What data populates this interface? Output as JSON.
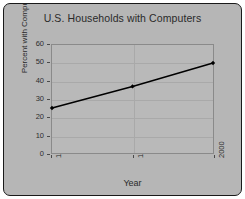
{
  "chart_data": {
    "type": "line",
    "title": "U.S. Households with Computers",
    "xlabel": "Year",
    "ylabel": "Percent with Computers",
    "categories": [
      "1994",
      "1997",
      "2000"
    ],
    "values": [
      25,
      37,
      50
    ],
    "ylim": [
      0,
      60
    ],
    "yticks": [
      0,
      10,
      20,
      30,
      40,
      50,
      60
    ],
    "ytick_labels": [
      "0",
      "10",
      "20",
      "30",
      "40",
      "50",
      "60"
    ],
    "xtick_labels": [
      "1994",
      "1997",
      "2000"
    ],
    "grid": true,
    "legend": false,
    "series": [
      {
        "name": "Percent with Computers",
        "values": [
          25,
          37,
          50
        ],
        "color": "#000000",
        "marker": "diamond"
      }
    ]
  },
  "style": {
    "figure_background": "#b6b6b6",
    "plot_background": "#b9b9b9",
    "frame_color": "#1a1a1a",
    "grid_color": "#a9a9a9",
    "text_color": "#2a2a2a",
    "line_color": "#000000"
  }
}
